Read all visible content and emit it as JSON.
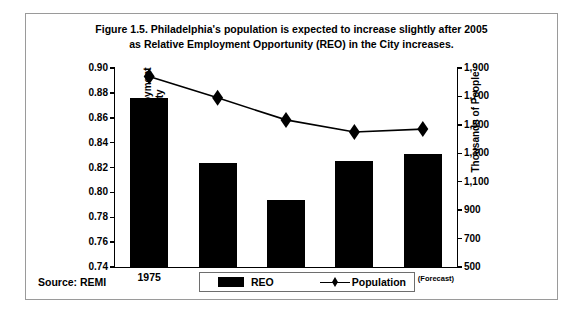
{
  "figure": {
    "title_line1": "Figure 1.5. Philadelphia's population is expected to increase slightly after 2005",
    "title_line2": "as Relative Employment Opportunity (REO) in the City increases.",
    "source": "Source: REMI"
  },
  "legend": {
    "position": "bottom-center",
    "entries": [
      {
        "label": "REO",
        "marker": "filled-bar",
        "color": "#000000"
      },
      {
        "label": "Population",
        "marker": "line-with-diamond",
        "color": "#000000"
      }
    ]
  },
  "chart_data": {
    "type": "bar",
    "title": "Figure 1.5. Philadelphia's population is expected to increase slightly after 2005 as Relative Employment Opportunity (REO) in the City increases.",
    "categories": [
      "1975",
      "1985",
      "1995",
      "2005",
      "2015"
    ],
    "category_notes": [
      "",
      "",
      "",
      "(Forecast)",
      "(Forecast)"
    ],
    "xlabel": "",
    "grid": false,
    "series": [
      {
        "name": "REO",
        "type": "bar",
        "axis": "left",
        "color": "#000000",
        "values": [
          0.876,
          0.824,
          0.794,
          0.825,
          0.831
        ]
      },
      {
        "name": "Population",
        "type": "line",
        "axis": "right",
        "color": "#000000",
        "marker": "diamond",
        "values": [
          1840,
          1690,
          1535,
          1450,
          1470
        ]
      }
    ],
    "axes": {
      "left": {
        "label": "Relative Employment Opportunity",
        "ylim": [
          0.74,
          0.9
        ],
        "ticks": [
          "0.74",
          "0.76",
          "0.78",
          "0.80",
          "0.82",
          "0.84",
          "0.86",
          "0.88",
          "0.90"
        ],
        "tick_values": [
          0.74,
          0.76,
          0.78,
          0.8,
          0.82,
          0.84,
          0.86,
          0.88,
          0.9
        ]
      },
      "right": {
        "label": "Thousands of People",
        "ylim": [
          500,
          1900
        ],
        "ticks": [
          "500",
          "700",
          "900",
          "1,100",
          "1,300",
          "1,500",
          "1,700",
          "1,900"
        ],
        "tick_values": [
          500,
          700,
          900,
          1100,
          1300,
          1500,
          1700,
          1900
        ]
      }
    }
  }
}
